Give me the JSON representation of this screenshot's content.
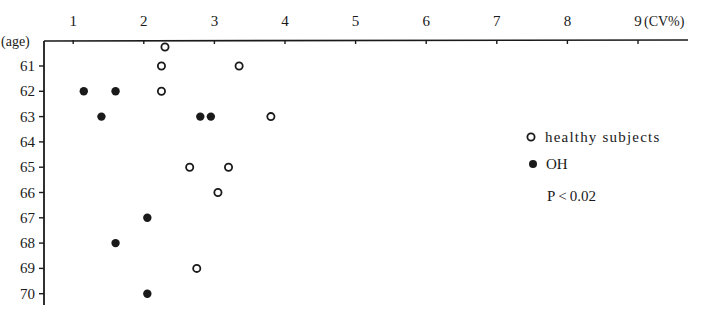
{
  "chart_data": {
    "type": "scatter",
    "title": "",
    "xlabel": "(CV%)",
    "ylabel": "(age)",
    "x_position": "top",
    "xlim": [
      0.6,
      9.7
    ],
    "ylim": [
      60,
      70.4
    ],
    "x_ticks": [
      1,
      2,
      3,
      4,
      5,
      6,
      7,
      8,
      9
    ],
    "y_ticks": [
      61,
      62,
      63,
      64,
      65,
      66,
      67,
      68,
      69,
      70
    ],
    "grid": false,
    "legend_position": "right",
    "series": [
      {
        "name": "healthy subjects",
        "marker": "open-circle",
        "points": [
          {
            "age": 60,
            "cv": 2.3
          },
          {
            "age": 61,
            "cv": 2.25
          },
          {
            "age": 61,
            "cv": 3.35
          },
          {
            "age": 62,
            "cv": 2.25
          },
          {
            "age": 63,
            "cv": 3.8
          },
          {
            "age": 65,
            "cv": 2.65
          },
          {
            "age": 65,
            "cv": 3.2
          },
          {
            "age": 66,
            "cv": 3.05
          },
          {
            "age": 69,
            "cv": 2.75
          }
        ]
      },
      {
        "name": "OH",
        "marker": "filled-circle",
        "points": [
          {
            "age": 62,
            "cv": 1.15
          },
          {
            "age": 62,
            "cv": 1.6
          },
          {
            "age": 63,
            "cv": 1.4
          },
          {
            "age": 63,
            "cv": 2.8
          },
          {
            "age": 63,
            "cv": 2.95
          },
          {
            "age": 67,
            "cv": 2.05
          },
          {
            "age": 68,
            "cv": 1.6
          },
          {
            "age": 70,
            "cv": 2.05
          }
        ]
      }
    ],
    "annotations": [
      "P<0.02"
    ]
  },
  "legend": {
    "healthy_label": "healthy subjects",
    "oh_label": "OH",
    "p_value": "P < 0.02"
  },
  "axes": {
    "x_unit_label": "(CV%)",
    "y_unit_label": "(age)"
  },
  "colors": {
    "ink": "#1a1a1a",
    "background": "#ffffff"
  }
}
